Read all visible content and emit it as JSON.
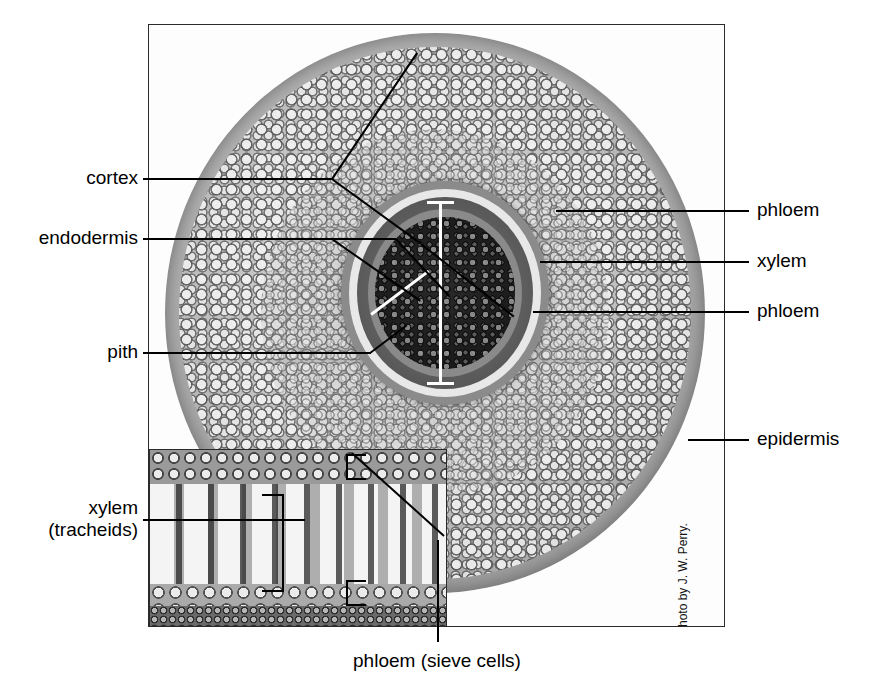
{
  "figure": {
    "credit": "Photo by J. W. Perry."
  },
  "labels": {
    "cortex": "cortex",
    "endodermis": "endodermis",
    "pith": "pith",
    "phloem_upper": "phloem",
    "xylem_right": "xylem",
    "phloem_lower": "phloem",
    "epidermis": "epidermis",
    "xylem_inset_line1": "xylem",
    "xylem_inset_line2": "(tracheids)",
    "phloem_sieve": "phloem (sieve cells)"
  },
  "colors": {
    "ink": "#000000",
    "frame": "#2b2b2b",
    "background": "#ffffff",
    "marker_white": "#ffffff"
  }
}
